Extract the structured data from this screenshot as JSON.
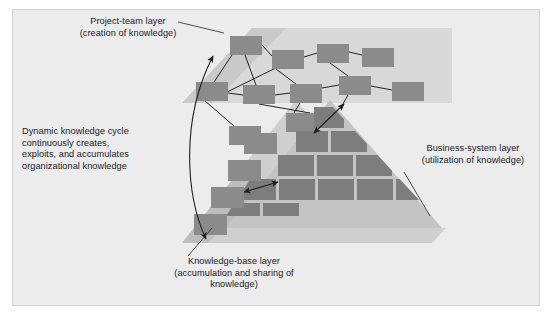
{
  "figure": {
    "background_color": "#ececed",
    "frame_border_color": "#d2d2d4",
    "band_color_light": "#d6d6d6",
    "band_color_mid": "#b9b9b9",
    "node_color": "#8a8a8a",
    "brick_color": "#7d7d7d",
    "line_color": "#2b2b2b"
  },
  "labels": {
    "project_team": "Project-team layer\n(creation of knowledge)",
    "dynamic_cycle": "Dynamic knowledge cycle\ncontinuously creates,\nexploits, and accumulates\norganizational knowledge",
    "knowledge_base": "Knowledge-base layer\n(accumulation and sharing of\nknowledge)",
    "business_system": "Business-system layer\n(utilization of knowledge)"
  },
  "layers": [
    {
      "id": "project-team",
      "name": "Project-team layer",
      "parenthetical": "creation of knowledge",
      "representation": "network of linked rectangular nodes",
      "node_count": 11
    },
    {
      "id": "knowledge-base",
      "name": "Knowledge-base layer",
      "parenthetical": "accumulation and sharing of knowledge",
      "representation": "descending stair-step rectangles on a light triangular band",
      "node_count": 4
    },
    {
      "id": "business-system",
      "name": "Business-system layer",
      "parenthetical": "utilization of knowledge",
      "representation": "triangular brick pyramid",
      "node_count": 13
    }
  ],
  "network_nodes": [
    {
      "id": "n1",
      "x": 230,
      "y": 36,
      "w": 32,
      "h": 19
    },
    {
      "id": "n2",
      "x": 272,
      "y": 50,
      "w": 32,
      "h": 19
    },
    {
      "id": "n3",
      "x": 317,
      "y": 44,
      "w": 32,
      "h": 19
    },
    {
      "id": "n4",
      "x": 362,
      "y": 48,
      "w": 32,
      "h": 19
    },
    {
      "id": "n5",
      "x": 196,
      "y": 82,
      "w": 32,
      "h": 19
    },
    {
      "id": "n6",
      "x": 243,
      "y": 85,
      "w": 32,
      "h": 19
    },
    {
      "id": "n7",
      "x": 290,
      "y": 84,
      "w": 32,
      "h": 19
    },
    {
      "id": "n8",
      "x": 339,
      "y": 76,
      "w": 32,
      "h": 19
    },
    {
      "id": "n9",
      "x": 286,
      "y": 113,
      "w": 32,
      "h": 19
    },
    {
      "id": "n10",
      "x": 229,
      "y": 126,
      "w": 32,
      "h": 19
    },
    {
      "id": "n11",
      "x": 330,
      "y": 109,
      "w": 30,
      "h": 19
    }
  ],
  "network_edges": [
    [
      "n1",
      "n2"
    ],
    [
      "n2",
      "n3"
    ],
    [
      "n3",
      "n4"
    ],
    [
      "n1",
      "n5"
    ],
    [
      "n1",
      "n6"
    ],
    [
      "n5",
      "n6"
    ],
    [
      "n6",
      "n7"
    ],
    [
      "n7",
      "n8"
    ],
    [
      "n2",
      "n7"
    ],
    [
      "n3",
      "n8"
    ],
    [
      "n5",
      "n2"
    ],
    [
      "n7",
      "n9"
    ],
    [
      "n6",
      "n9"
    ],
    [
      "n8",
      "n11"
    ],
    [
      "n5",
      "n10"
    ]
  ],
  "stair_nodes": [
    {
      "id": "k1",
      "x": 228,
      "y": 133,
      "w": 33,
      "h": 20
    },
    {
      "id": "k2",
      "x": 216,
      "y": 160,
      "w": 33,
      "h": 20
    },
    {
      "id": "k3",
      "x": 203,
      "y": 187,
      "w": 33,
      "h": 20
    },
    {
      "id": "k4",
      "x": 190,
      "y": 214,
      "w": 33,
      "h": 20
    }
  ],
  "brick_rows": [
    {
      "row": 1,
      "y": 113,
      "bricks": [
        {
          "x": 316,
          "w": 28
        }
      ]
    },
    {
      "row": 2,
      "y": 137,
      "bricks": [
        {
          "x": 300,
          "w": 28
        },
        {
          "x": 332,
          "w": 35
        }
      ]
    },
    {
      "row": 3,
      "y": 161,
      "bricks": [
        {
          "x": 285,
          "w": 33
        },
        {
          "x": 322,
          "w": 35
        },
        {
          "x": 361,
          "w": 33
        }
      ]
    },
    {
      "row": 4,
      "y": 185,
      "bricks": [
        {
          "x": 242,
          "w": 37
        },
        {
          "x": 283,
          "w": 35
        },
        {
          "x": 322,
          "w": 35
        },
        {
          "x": 361,
          "w": 35
        }
      ]
    }
  ],
  "arrows": [
    {
      "id": "dynamic-cycle-arc",
      "type": "curved-double-ended",
      "from": "knowledge-base layer",
      "to": "project-team layer",
      "description": "long curved arc on the left with arrowheads at both ends"
    },
    {
      "id": "project-to-business",
      "type": "double-headed",
      "description": "short diagonal double-headed arrow between network and pyramid apex"
    },
    {
      "id": "knowledge-to-business",
      "type": "double-headed",
      "description": "short horizontal double-headed arrow between stair steps and pyramid"
    }
  ],
  "leader_lines": [
    {
      "id": "project-team-leader",
      "from_label": "project_team",
      "to": "project-team layer band"
    },
    {
      "id": "knowledge-base-leader",
      "from_label": "knowledge_base",
      "to": "knowledge-base triangle"
    },
    {
      "id": "business-system-leader",
      "from_label": "business_system",
      "to": "business-system pyramid"
    }
  ]
}
